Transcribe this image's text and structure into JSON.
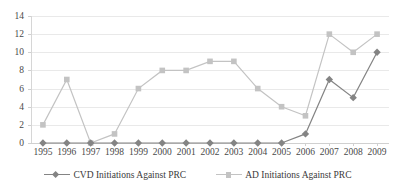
{
  "chart_data": {
    "type": "line",
    "title": "",
    "subtitle": "",
    "xlabel": "",
    "ylabel": "",
    "categories": [
      "1995",
      "1996",
      "1997",
      "1998",
      "1999",
      "2000",
      "2001",
      "2002",
      "2003",
      "2004",
      "2005",
      "2006",
      "2007",
      "2008",
      "2009"
    ],
    "ylim": [
      0,
      14
    ],
    "yticks": [
      "0",
      "2",
      "4",
      "6",
      "8",
      "10",
      "12",
      "14"
    ],
    "ytick_values": [
      0,
      2,
      4,
      6,
      8,
      10,
      12,
      14
    ],
    "grid": true,
    "legend_position": "bottom",
    "series": [
      {
        "name": "CVD Initiations Against PRC",
        "color": "#848484",
        "marker": "diamond",
        "values": [
          0,
          0,
          0,
          0,
          0,
          0,
          0,
          0,
          0,
          0,
          0,
          1,
          7,
          5,
          10
        ]
      },
      {
        "name": "AD Initiations Against PRC",
        "color": "#c3c3c3",
        "marker": "square",
        "values": [
          2,
          7,
          0,
          1,
          6,
          8,
          8,
          9,
          9,
          6,
          4,
          3,
          12,
          10,
          12
        ]
      }
    ]
  },
  "legend": {
    "entries": [
      {
        "label": "CVD Initiations Against PRC"
      },
      {
        "label": "AD Initiations Against PRC"
      }
    ]
  },
  "colors": {
    "cvd_series": "#848484",
    "ad_series": "#c3c3c3",
    "gridline": "#e9e9e9",
    "axis": "#d0d0d0",
    "text": "#494949",
    "background": "#ffffff"
  }
}
